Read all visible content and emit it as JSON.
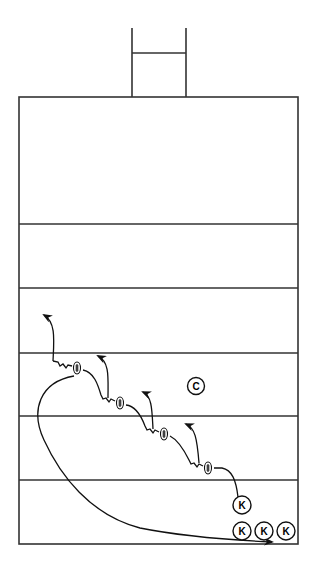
{
  "diagram": {
    "type": "football-kickoff-play",
    "line_color": "#222222",
    "background": "#ffffff",
    "field": {
      "left": 19,
      "right": 298,
      "top": 97,
      "bottom": 544
    },
    "yard_lines_y": [
      224,
      288,
      353,
      416,
      480
    ],
    "goalpost": {
      "left_x": 132,
      "right_x": 186,
      "top_y": 28,
      "crossbar_y": 53,
      "base_y": 97
    },
    "players": [
      {
        "label": "C",
        "role": "center",
        "x": 196,
        "y": 386
      },
      {
        "label": "K",
        "role": "kicker",
        "x": 242,
        "y": 505
      },
      {
        "label": "K",
        "role": "kicker",
        "x": 242,
        "y": 531
      },
      {
        "label": "K",
        "role": "kicker",
        "x": 264,
        "y": 531
      },
      {
        "label": "K",
        "role": "kicker",
        "x": 286,
        "y": 531
      }
    ],
    "footballs": [
      {
        "x": 77,
        "y": 368
      },
      {
        "x": 120,
        "y": 403
      },
      {
        "x": 164,
        "y": 434
      },
      {
        "x": 208,
        "y": 468
      }
    ]
  }
}
